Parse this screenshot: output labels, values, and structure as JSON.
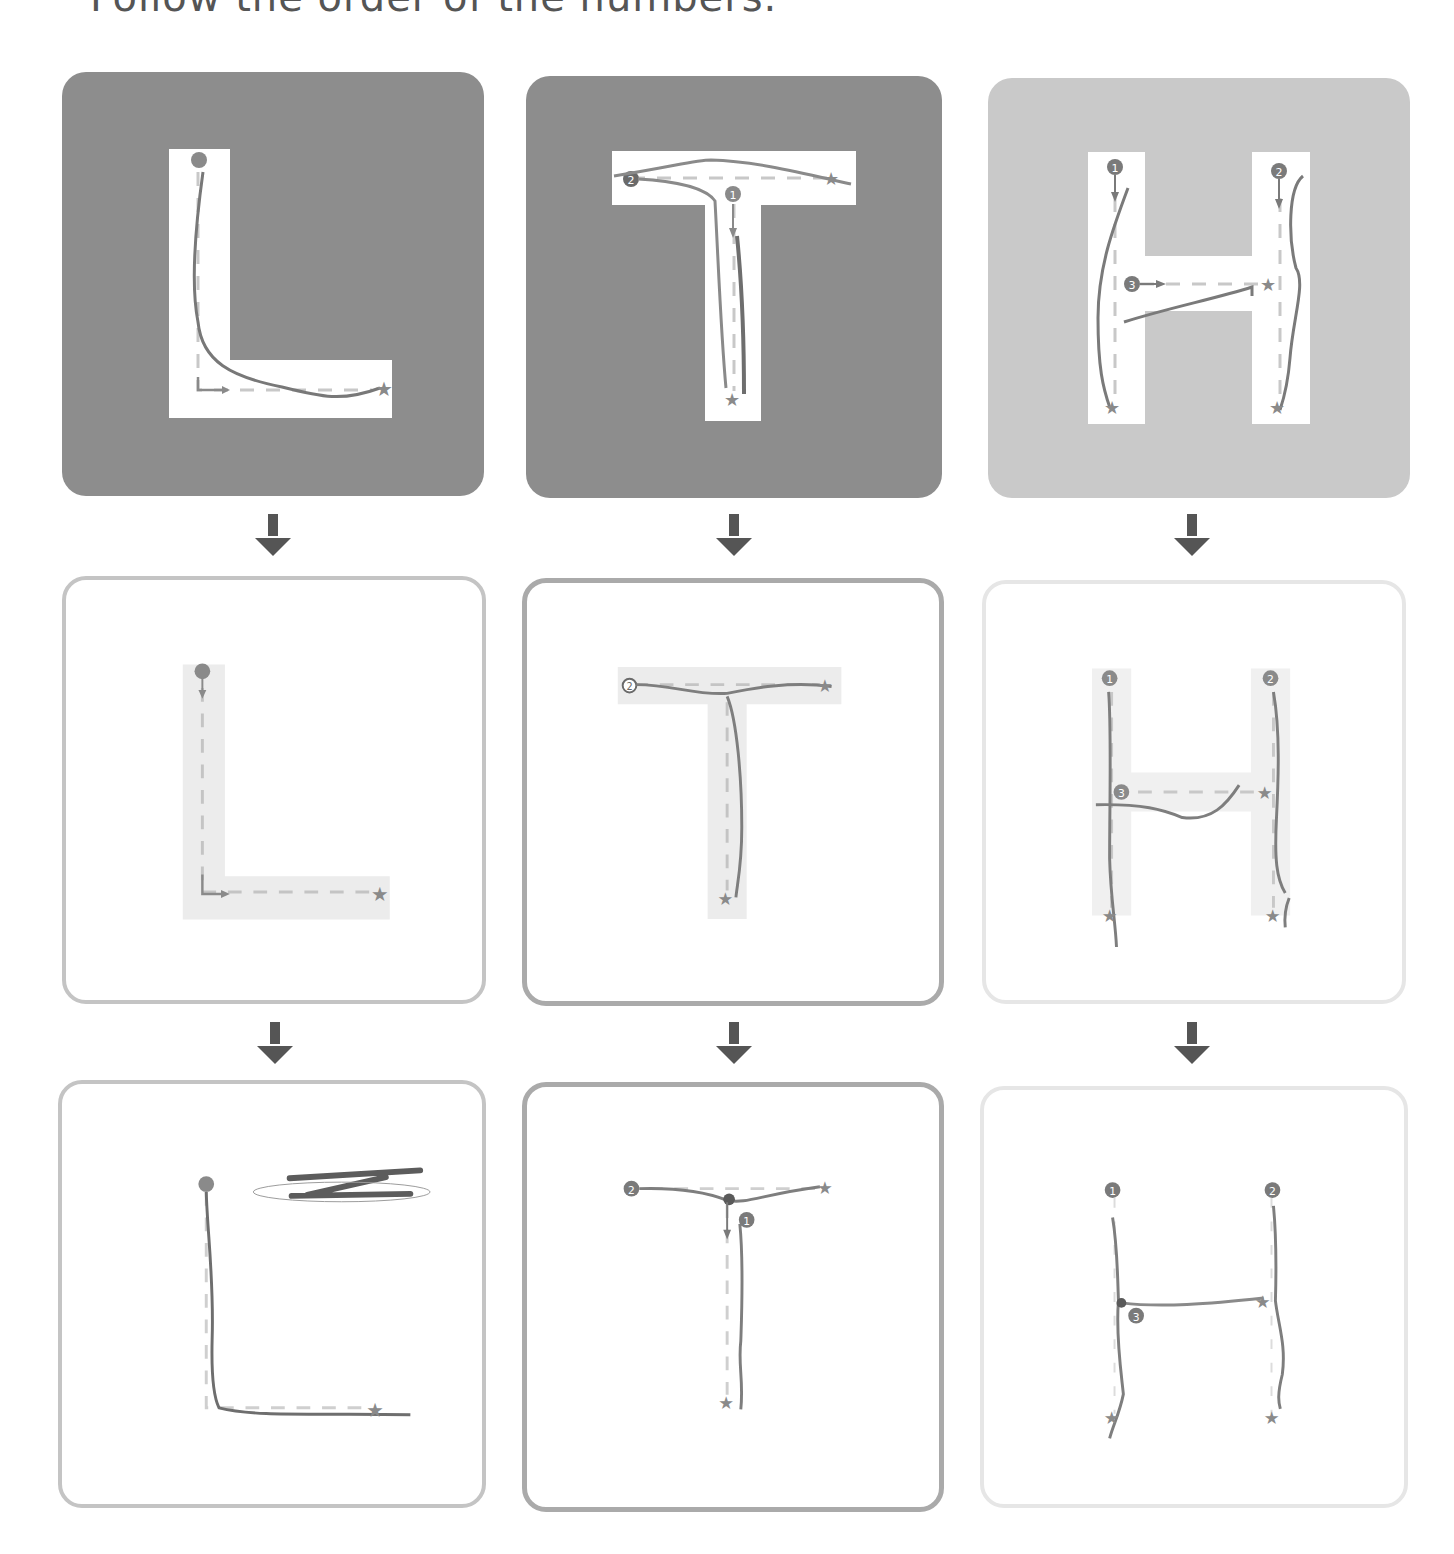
{
  "caption": "Follow the order of the numbers.",
  "colors": {
    "dark_panel": "#8c8c8c",
    "light_panel": "#c9c9c9",
    "letter_fill": "#ffffff",
    "letter_ghost": "#ececec",
    "stroke": "#7a7a7a",
    "guide": "#c8c8c8",
    "marker": "#8a8a8a",
    "arrow": "#555555"
  },
  "columns": [
    {
      "letter": "L",
      "stages": [
        {
          "stage": "template-dark",
          "start_marker": "dot"
        },
        {
          "stage": "guide-light",
          "start_marker": "dot"
        },
        {
          "stage": "freehand",
          "start_marker": "dot"
        }
      ]
    },
    {
      "letter": "T",
      "stages": [
        {
          "stage": "template-dark",
          "markers": [
            "1",
            "2"
          ]
        },
        {
          "stage": "guide-light",
          "markers": [
            "2"
          ]
        },
        {
          "stage": "freehand",
          "markers": [
            "2",
            "1"
          ]
        }
      ]
    },
    {
      "letter": "H",
      "stages": [
        {
          "stage": "template-light",
          "markers": [
            "1",
            "2",
            "3"
          ]
        },
        {
          "stage": "guide-light",
          "markers": [
            "1",
            "2",
            "3"
          ]
        },
        {
          "stage": "freehand",
          "markers": [
            "1",
            "2",
            "3"
          ]
        }
      ]
    }
  ],
  "markers": {
    "one": "1",
    "two": "2",
    "three": "3"
  }
}
